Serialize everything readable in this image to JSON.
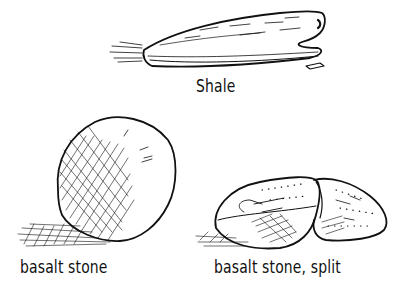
{
  "figure": {
    "type": "hand-drawn illustration",
    "ink_color": "#111111",
    "background_color": "#ffffff",
    "items": [
      {
        "id": "shale",
        "label": "Shale",
        "depiction": "flat layered wedge-shaped stone with small chip beside it"
      },
      {
        "id": "basalt",
        "label": "basalt stone",
        "depiction": "rounded stone with cross-hatched shading on left side and cast shadow"
      },
      {
        "id": "basalt-split",
        "label": "basalt stone, split",
        "depiction": "stone split into two halves showing speckled interior"
      }
    ]
  }
}
